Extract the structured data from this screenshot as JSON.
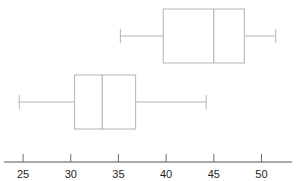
{
  "chart_data": {
    "type": "box",
    "title": "",
    "xlabel": "",
    "ylabel": "",
    "orientation": "horizontal",
    "xlim": [
      23.0,
      53.2
    ],
    "grid": false,
    "legend": null,
    "axis_ticks": [
      25,
      30,
      35,
      40,
      45,
      50
    ],
    "axis_tick_labels": [
      "25",
      "30",
      "35",
      "40",
      "45",
      "50"
    ],
    "series": [
      {
        "name": "upper-boxplot",
        "position": 2,
        "whisker_low": 35.2,
        "q1": 39.7,
        "median": 45.0,
        "q3": 48.2,
        "whisker_high": 51.5
      },
      {
        "name": "lower-boxplot",
        "position": 1,
        "whisker_low": 24.6,
        "q1": 30.4,
        "median": 33.3,
        "q3": 36.8,
        "whisker_high": 44.2
      }
    ]
  },
  "colors": {
    "box_stroke": "#b3b3b3",
    "whisker_stroke": "#b3b3b3",
    "median_stroke": "#a8a8a8",
    "axis_stroke": "#8c8c8c",
    "tick_stroke": "#6e6e6e",
    "label_text": "#231f20",
    "background": "#ffffff"
  },
  "clipped_header": {
    "text": ""
  }
}
